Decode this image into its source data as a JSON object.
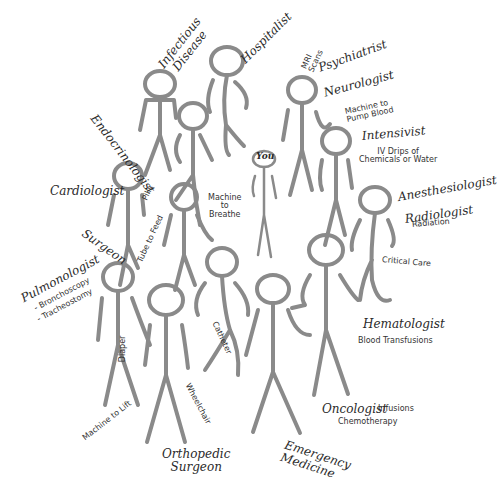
{
  "diagram": {
    "center_label": "You",
    "colors": {
      "figure_stroke": "#8a8a8a",
      "text": "#2a2a2a",
      "background": "#ffffff"
    },
    "specialists": [
      {
        "id": "infectious-disease",
        "label": "Infectious Disease"
      },
      {
        "id": "hospitalist",
        "label": "Hospitalist"
      },
      {
        "id": "endocrinologist",
        "label": "Endocrinologist"
      },
      {
        "id": "psychiatrist",
        "label": "Psychiatrist"
      },
      {
        "id": "neurologist",
        "label": "Neurologist"
      },
      {
        "id": "intensivist",
        "label": "Intensivist"
      },
      {
        "id": "cardiologist",
        "label": "Cardiologist"
      },
      {
        "id": "anesthesiologist",
        "label": "Anesthesiologist"
      },
      {
        "id": "radiologist",
        "label": "Radiologist"
      },
      {
        "id": "surgeon",
        "label": "Surgeon"
      },
      {
        "id": "pulmonologist",
        "label": "Pulmonologist"
      },
      {
        "id": "hematologist",
        "label": "Hematologist"
      },
      {
        "id": "oncologist",
        "label": "Oncologist"
      },
      {
        "id": "orthopedic-surgeon",
        "label": "Orthopedic Surgeon"
      },
      {
        "id": "emergency-medicine",
        "label": "Emergency Medicine"
      }
    ],
    "treatments": {
      "mri": "MRI Scans",
      "pump": "Machine to Pump Blood",
      "iv": "IV Drips of Chemicals or Water",
      "radiation": "Radiation",
      "critical_care": "Critical Care",
      "pills": "Pills",
      "breathe": "Machine to Breathe",
      "feed": "Tube to Feed",
      "bronchoscopy": "- Bronchoscopy",
      "tracheostomy": "- Tracheostomy",
      "catheter": "Catheter",
      "diaper": "Diaper",
      "wheelchair": "Wheelchair",
      "lift": "Machine to Lift",
      "blood": "Blood Transfusions",
      "infusions": "Infusions",
      "chemo": "Chemotherapy"
    },
    "split_labels": {
      "infectious_1": "Infectious",
      "infectious_2": "Disease",
      "pump_1": "Machine to",
      "pump_2": "Pump Blood",
      "iv_1": "IV Drips of",
      "iv_2": "Chemicals or Water",
      "mri_1": "MRI",
      "mri_2": "Scans",
      "breathe_1": "Machine",
      "breathe_2": "to",
      "breathe_3": "Breathe",
      "ortho_1": "Orthopedic",
      "ortho_2": "Surgeon",
      "em_1": "Emergency",
      "em_2": "Medicine"
    }
  }
}
